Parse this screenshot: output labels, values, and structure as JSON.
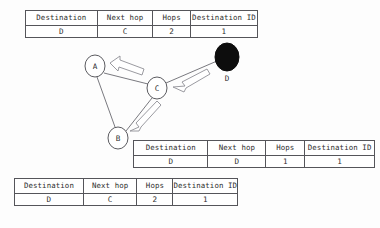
{
  "figure": {
    "type": "routing-table-network-diagram",
    "columns": [
      "Destination",
      "Next hop",
      "Hops",
      "Destination ID"
    ],
    "tables": [
      {
        "id": "top",
        "position": "top",
        "rows": [
          {
            "destination": "D",
            "next_hop": "C",
            "hops": "2",
            "destination_id": "1"
          }
        ]
      },
      {
        "id": "middle",
        "position": "middle-right",
        "rows": [
          {
            "destination": "D",
            "next_hop": "D",
            "hops": "1",
            "destination_id": "1"
          }
        ]
      },
      {
        "id": "bottom",
        "position": "bottom-left",
        "rows": [
          {
            "destination": "D",
            "next_hop": "C",
            "hops": "2",
            "destination_id": "1"
          }
        ]
      }
    ],
    "diagram": {
      "nodes": [
        {
          "id": "A",
          "label": "A",
          "style": "hollow",
          "cx": 95,
          "cy": 66,
          "rx": 10,
          "ry": 11
        },
        {
          "id": "B",
          "label": "B",
          "style": "hollow",
          "cx": 118,
          "cy": 138,
          "rx": 10,
          "ry": 11
        },
        {
          "id": "C",
          "label": "C",
          "style": "hollow",
          "cx": 157,
          "cy": 88,
          "rx": 10,
          "ry": 11
        },
        {
          "id": "D",
          "label": "D",
          "style": "filled",
          "cx": 227,
          "cy": 57,
          "rx": 12,
          "ry": 14
        }
      ],
      "links": [
        {
          "from": "A",
          "to": "C"
        },
        {
          "from": "A",
          "to": "B"
        },
        {
          "from": "B",
          "to": "C"
        },
        {
          "from": "C",
          "to": "D"
        }
      ],
      "message_arrows": [
        {
          "from": "C",
          "to": "A",
          "style": "hollow-block"
        },
        {
          "from": "D",
          "to": "C",
          "style": "hollow-block"
        },
        {
          "from": "C",
          "to": "B",
          "style": "hollow-block"
        }
      ],
      "colors": {
        "node_stroke": "#5b5b60",
        "node_fill": "#ffffff",
        "filled_node": "#0d0d0d",
        "link": "#6a6a70",
        "arrow_stroke": "#8a8a90",
        "arrow_fill": "#ffffff"
      }
    }
  }
}
